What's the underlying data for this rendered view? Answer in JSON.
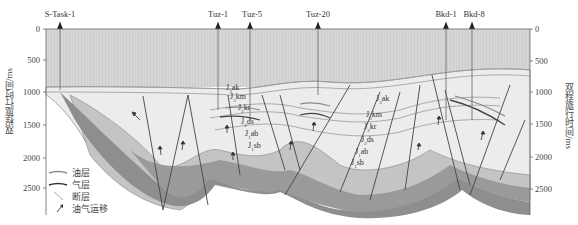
{
  "figure": {
    "wells": [
      {
        "name": "S-Task-1",
        "x": 60
      },
      {
        "name": "Tuz-1",
        "x": 218
      },
      {
        "name": "Tuz-5",
        "x": 250
      },
      {
        "name": "Tuz-20",
        "x": 318
      },
      {
        "name": "Bkd-1",
        "x": 446
      },
      {
        "name": "Bkd-8",
        "x": 472
      }
    ],
    "left_axis": {
      "label": "双程旅行时间/ms",
      "ticks": [
        "0",
        "500",
        "1000",
        "1500",
        "2000",
        "2500"
      ]
    },
    "right_axis": {
      "label": "双程旅行时间/ms",
      "ticks": [
        "0",
        "500",
        "1000",
        "1500",
        "2000",
        "2500"
      ]
    },
    "formations_west": [
      "J3ak",
      "J3km",
      "J2kr",
      "J2ds",
      "J1ab",
      "J1sb"
    ],
    "formations_east": [
      "J3ak",
      "J3km",
      "J2kr",
      "J2ds",
      "J1ab",
      "J1sb"
    ],
    "formation_labels_west": [
      {
        "main": "J",
        "sub": "3",
        "tail": "ak"
      },
      {
        "main": "J",
        "sub": "3",
        "tail": "km"
      },
      {
        "main": "J",
        "sub": "2",
        "tail": "kr"
      },
      {
        "main": "J",
        "sub": "2",
        "tail": "ds"
      },
      {
        "main": "J",
        "sub": "1",
        "tail": "ab"
      },
      {
        "main": "J",
        "sub": "1",
        "tail": "sb"
      }
    ],
    "formation_labels_east": [
      {
        "main": "J",
        "sub": "3",
        "tail": "ak"
      },
      {
        "main": "J",
        "sub": "3",
        "tail": "km"
      },
      {
        "main": "J",
        "sub": "2",
        "tail": "kr"
      },
      {
        "main": "J",
        "sub": "2",
        "tail": "ds"
      },
      {
        "main": "J",
        "sub": "1",
        "tail": "ab"
      },
      {
        "main": "J",
        "sub": "1",
        "tail": "sb"
      }
    ],
    "legend": [
      {
        "key": "oil-layer",
        "label": "油层",
        "color": "#8a8a8a"
      },
      {
        "key": "gas-layer",
        "label": "气层",
        "color": "#333333"
      },
      {
        "key": "fault",
        "label": "断层",
        "color": "#b0b0b0"
      },
      {
        "key": "migration",
        "label": "油气运移",
        "color": "#333333"
      }
    ],
    "colors": {
      "upper_fill": "#d9d9d9",
      "mid_fill": "#e8e8e8",
      "layer_light": "#cfcfcf",
      "layer_mid": "#b5b5b5",
      "basement": "#8c8c8c",
      "fault": "#444444"
    }
  }
}
